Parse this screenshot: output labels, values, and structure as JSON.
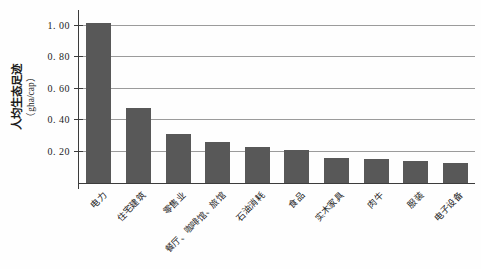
{
  "chart_data": {
    "type": "bar",
    "title": "",
    "ylabel": "人均生态足迹",
    "ylabel_unit": "（gha/cap）",
    "xlabel": "",
    "categories": [
      "电力",
      "住宅建筑",
      "零售业",
      "餐厅、咖啡馆、旅馆",
      "石油消耗",
      "食品",
      "实木家具",
      "肉牛",
      "服装",
      "电子设备"
    ],
    "values": [
      1.02,
      0.48,
      0.31,
      0.26,
      0.23,
      0.21,
      0.16,
      0.15,
      0.14,
      0.13
    ],
    "ylim": [
      0,
      1.1
    ],
    "yticks": [
      0.2,
      0.4,
      0.6,
      0.8,
      1.0
    ],
    "ytick_labels": [
      "0. 20",
      "0. 40",
      "0. 60",
      "0. 80",
      "1. 00"
    ],
    "grid": true,
    "legend": "none",
    "bar_color": "#585858",
    "gridline_color": "#9b9b9b",
    "axis_color": "#3c3c3c",
    "background": "#fefefe"
  }
}
